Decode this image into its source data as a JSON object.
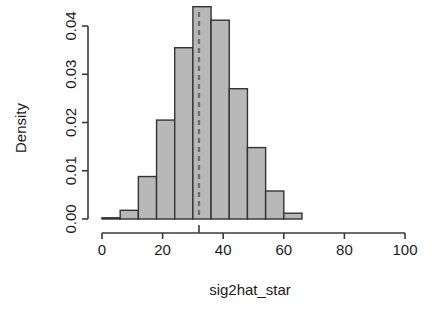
{
  "chart_data": {
    "type": "bar",
    "subtype": "histogram",
    "title": "",
    "subtitle": "",
    "xlabel": "sig2hat_star",
    "ylabel": "Density",
    "xlim": [
      0,
      100
    ],
    "ylim": [
      0.0,
      0.045
    ],
    "grid": false,
    "legend": null,
    "bin_width": 6,
    "bin_edges": [
      0,
      6,
      12,
      18,
      24,
      30,
      36,
      42,
      48,
      54,
      60,
      66
    ],
    "categories": [
      "0-6",
      "6-12",
      "12-18",
      "18-24",
      "24-30",
      "30-36",
      "36-42",
      "42-48",
      "48-54",
      "54-60",
      "60-66"
    ],
    "values": [
      0.0002,
      0.0018,
      0.0088,
      0.0205,
      0.0355,
      0.044,
      0.0412,
      0.027,
      0.0148,
      0.0058,
      0.0012
    ],
    "xticks": [
      0,
      20,
      40,
      60,
      80,
      100
    ],
    "xtick_labels": [
      "0",
      "20",
      "40",
      "60",
      "80",
      "100"
    ],
    "yticks": [
      0.0,
      0.01,
      0.02,
      0.03,
      0.04
    ],
    "ytick_labels": [
      "0.00",
      "0.01",
      "0.02",
      "0.03",
      "0.04"
    ],
    "annotations": [
      {
        "name": "reference-line",
        "type": "vline",
        "x": 32,
        "style": "dashed",
        "color": "#6e6e6e",
        "label": ""
      }
    ],
    "colors": {
      "bar_fill": "#b8b8b8",
      "bar_stroke": "#333333",
      "axis": "#3a3a3a",
      "reference_line": "#6e6e6e",
      "background": "#ffffff"
    }
  }
}
